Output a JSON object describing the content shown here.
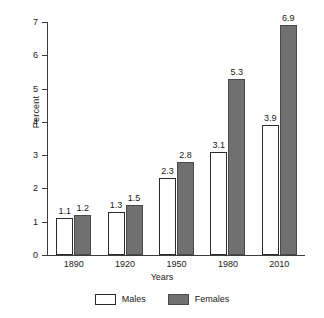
{
  "chart_data": {
    "type": "bar",
    "title": "",
    "subtitle": "",
    "xlabel": "Years",
    "ylabel": "Percent",
    "categories": [
      "1890",
      "1920",
      "1950",
      "1980",
      "2010"
    ],
    "series": [
      {
        "name": "Males",
        "values": [
          1.1,
          1.3,
          2.3,
          3.1,
          3.9
        ],
        "color": "#ffffff"
      },
      {
        "name": "Females",
        "values": [
          1.2,
          1.5,
          2.8,
          5.3,
          6.9
        ],
        "color": "#707070"
      }
    ],
    "value_labels": {
      "Males": [
        "1.1",
        "1.3",
        "2.3",
        "3.1",
        "3.9"
      ],
      "Females": [
        "1.2",
        "1.5",
        "2.8",
        "5.3",
        "6.9"
      ]
    },
    "ylim": [
      0,
      7
    ],
    "yticks": [
      0,
      1,
      2,
      3,
      4,
      5,
      6,
      7
    ],
    "ytick_labels": [
      "0",
      "1",
      "2",
      "3",
      "4",
      "5",
      "6",
      "7"
    ],
    "grid": false,
    "legend_position": "bottom"
  },
  "legend": {
    "items": [
      {
        "label": "Males",
        "swatch": "males-swatch"
      },
      {
        "label": "Females",
        "swatch": "females-swatch"
      }
    ]
  },
  "axes": {
    "y_title": "Percent",
    "x_title": "Years"
  }
}
